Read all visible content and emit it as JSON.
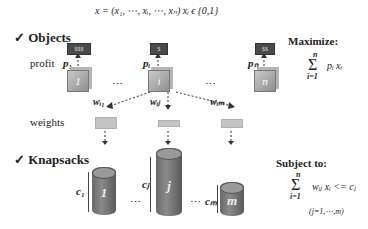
{
  "header": {
    "formula": "x = (x₁, ⋯, xᵢ, ⋯, xₙ)     xᵢ ϵ {0,1}"
  },
  "objects": {
    "heading": "✓ Objects",
    "profit_label": "profit",
    "weights_label": "weights",
    "items": [
      {
        "id": "1",
        "tag": "$$$",
        "profit": "p₁"
      },
      {
        "id": "i",
        "tag": "$",
        "profit": "pᵢ"
      },
      {
        "id": "n",
        "tag": "$$",
        "profit": "pₙ"
      }
    ],
    "weights": [
      "w_i1",
      "w_ij",
      "w_im"
    ],
    "weight_labels": [
      "wᵢ₁",
      "wᵢⱼ",
      "wᵢₘ"
    ],
    "ellipsis": "⋯"
  },
  "knapsacks": {
    "heading": "✓ Knapsacks",
    "items": [
      {
        "id": "1",
        "capacity": "c₁"
      },
      {
        "id": "j",
        "capacity": "cⱼ"
      },
      {
        "id": "m",
        "capacity": "cₘ"
      }
    ],
    "ellipsis": "⋯"
  },
  "objective": {
    "title": "Maximize:",
    "sum_top": "n",
    "sigma": "Σ",
    "sum_bottom": "i=1",
    "expr": "pᵢ xᵢ"
  },
  "constraint": {
    "title": "Subject to:",
    "sum_top": "n",
    "sigma": "Σ",
    "sum_bottom": "i=1",
    "expr": "wᵢⱼ xᵢ <= cⱼ",
    "range": "(j=1,⋯,m)"
  },
  "colors": {
    "tag_bg": "#4a4a4a",
    "cube": "#a8a8a8",
    "cylinder": "#737373",
    "weight_bar": "#c4c4c4"
  }
}
